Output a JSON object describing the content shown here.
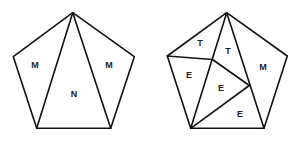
{
  "diagram": {
    "left_pentagon": {
      "vertices": {
        "top": [
          72.7,
          12.7
        ],
        "left": [
          13.3,
          56.7
        ],
        "right": [
          134.3,
          56.7
        ],
        "bottom_left": [
          36.7,
          128.3
        ],
        "bottom_right": [
          110.7,
          128.3
        ]
      },
      "regions": [
        {
          "label": "M",
          "x": 35,
          "y": 66
        },
        {
          "label": "N",
          "x": 74,
          "y": 95
        },
        {
          "label": "M",
          "x": 109,
          "y": 66
        }
      ]
    },
    "right_pentagon": {
      "vertices": {
        "top": [
          226.7,
          12.7
        ],
        "left": [
          167.3,
          56
        ],
        "right": [
          287.3,
          56
        ],
        "bottom_left": [
          190.7,
          128.3
        ],
        "bottom_right": [
          264,
          128.3
        ],
        "inner_1": [
          212.5,
          59.5
        ],
        "inner_2": [
          249.3,
          85.5
        ]
      },
      "regions": [
        {
          "label": "T",
          "x": 200,
          "y": 44
        },
        {
          "label": "T",
          "x": 228,
          "y": 52
        },
        {
          "label": "E",
          "x": 189,
          "y": 76
        },
        {
          "label": "E",
          "x": 221,
          "y": 89
        },
        {
          "label": "M",
          "x": 263,
          "y": 68
        },
        {
          "label": "E",
          "x": 240,
          "y": 115
        }
      ]
    },
    "stroke_color": "#111111",
    "background": "#ffffff"
  }
}
